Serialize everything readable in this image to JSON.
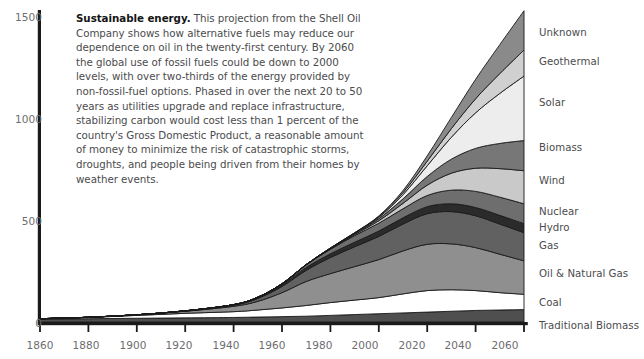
{
  "caption": {
    "lead": "Sustainable energy.",
    "body": " This projection from the Shell Oil Company shows how alternative fuels may reduce our dependence on oil in the twenty-first century. By 2060 the global use of fossil fuels could be down to 2000 levels, with over two-thirds of the energy provided by non-fossil-fuel options. Phased in over the next 20 to 50 years as utilities upgrade and replace infrastructure, stabilizing carbon would cost less than 1 percent of the country's Gross Domestic Product, a reasonable amount of money to minimize the risk of catastrophic storms, droughts, and people being driven from their homes by weather events."
  },
  "colors": {
    "axis": "#1a1a1a",
    "tick_text": "#6d6d6f",
    "caption_text": "#4b4b4d",
    "band_stroke": "#1a1a1a",
    "traditional_biomass": "#4f4f4f",
    "coal": "#ffffff",
    "oil_natural_gas": "#8f8f8f",
    "gas": "#616161",
    "hydro": "#2b2b2b",
    "nuclear": "#6e6e6e",
    "wind": "#c9c9c9",
    "biomass": "#777777",
    "solar": "#ededed",
    "geothermal": "#d0d0d0",
    "unknown": "#8a8a8a"
  },
  "chart_data": {
    "type": "area",
    "stacked": true,
    "title": "",
    "xlabel": "",
    "ylabel": "",
    "xlim": [
      1860,
      2060
    ],
    "ylim": [
      0,
      1500
    ],
    "grid": false,
    "legend_position": "right-outside",
    "x_ticks": [
      1860,
      1880,
      1900,
      1920,
      1940,
      1960,
      1980,
      2000,
      2020,
      2040,
      2060
    ],
    "y_ticks": [
      0,
      500,
      1000,
      1500
    ],
    "x": [
      1860,
      1880,
      1900,
      1920,
      1940,
      1950,
      1960,
      1970,
      1980,
      1990,
      2000,
      2010,
      2020,
      2030,
      2040,
      2050,
      2060
    ],
    "series": [
      {
        "name": "Traditional Biomass",
        "color": "#4f4f4f",
        "values": [
          14,
          16,
          18,
          20,
          22,
          24,
          26,
          28,
          32,
          36,
          40,
          44,
          48,
          52,
          56,
          58,
          60
        ]
      },
      {
        "name": "Coal",
        "color": "#ffffff",
        "values": [
          2,
          6,
          14,
          22,
          28,
          34,
          42,
          52,
          62,
          70,
          78,
          92,
          104,
          104,
          96,
          84,
          74
        ]
      },
      {
        "name": "Oil & Natural Gas",
        "color": "#8f8f8f",
        "values": [
          0,
          1,
          3,
          10,
          26,
          42,
          74,
          116,
          140,
          162,
          184,
          208,
          224,
          222,
          208,
          186,
          162
        ]
      },
      {
        "name": "Gas",
        "color": "#616161",
        "values": [
          0,
          0,
          0,
          1,
          5,
          14,
          30,
          54,
          78,
          96,
          112,
          130,
          148,
          156,
          154,
          146,
          136
        ]
      },
      {
        "name": "Hydro",
        "color": "#2b2b2b",
        "values": [
          0,
          0,
          0,
          1,
          3,
          5,
          9,
          14,
          18,
          22,
          26,
          30,
          34,
          38,
          40,
          42,
          44
        ]
      },
      {
        "name": "Nuclear",
        "color": "#6e6e6e",
        "values": [
          0,
          0,
          0,
          0,
          0,
          1,
          4,
          12,
          22,
          32,
          38,
          44,
          54,
          66,
          78,
          88,
          96
        ]
      },
      {
        "name": "Wind",
        "color": "#c9c9c9",
        "values": [
          0,
          0,
          0,
          0,
          0,
          0,
          0,
          1,
          2,
          5,
          12,
          26,
          50,
          82,
          112,
          138,
          160
        ]
      },
      {
        "name": "Biomass",
        "color": "#777777",
        "values": [
          0,
          0,
          0,
          0,
          0,
          0,
          0,
          1,
          2,
          4,
          10,
          22,
          42,
          68,
          96,
          122,
          146
        ]
      },
      {
        "name": "Solar",
        "color": "#ededed",
        "values": [
          0,
          0,
          0,
          0,
          0,
          0,
          0,
          0,
          1,
          2,
          6,
          20,
          52,
          106,
          172,
          242,
          312
        ]
      },
      {
        "name": "Geothermal",
        "color": "#d0d0d0",
        "values": [
          0,
          0,
          0,
          0,
          0,
          0,
          0,
          0,
          1,
          2,
          4,
          10,
          22,
          42,
          68,
          96,
          126
        ]
      },
      {
        "name": "Unknown",
        "color": "#8a8a8a",
        "values": [
          0,
          0,
          0,
          0,
          0,
          0,
          0,
          0,
          0,
          1,
          3,
          10,
          26,
          54,
          94,
          140,
          190
        ]
      }
    ]
  },
  "legend": [
    {
      "label": "Unknown",
      "top": 27
    },
    {
      "label": "Geothermal",
      "top": 56
    },
    {
      "label": "Solar",
      "top": 97
    },
    {
      "label": "Biomass",
      "top": 142
    },
    {
      "label": "Wind",
      "top": 175
    },
    {
      "label": "Nuclear",
      "top": 206
    },
    {
      "label": "Hydro",
      "top": 222
    },
    {
      "label": "Gas",
      "top": 240
    },
    {
      "label": "Oil & Natural Gas",
      "top": 268
    },
    {
      "label": "Coal",
      "top": 297
    },
    {
      "label": "Traditional Biomass",
      "top": 320
    }
  ],
  "axes": {
    "y_tick_labels": [
      "1500",
      "1000",
      "500",
      "0"
    ],
    "x_tick_labels": [
      "1860",
      "1880",
      "1900",
      "1920",
      "1940",
      "1960",
      "1980",
      "2000",
      "2020",
      "2040",
      "2060"
    ]
  }
}
